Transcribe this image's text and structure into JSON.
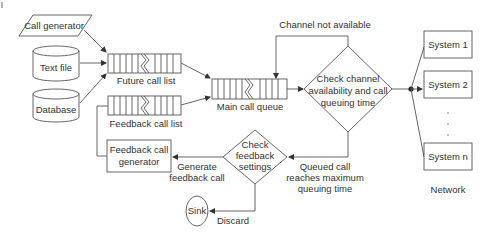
{
  "diagram": {
    "sources": {
      "call_generator": "Call generator",
      "text_file": "Text file",
      "database": "Database"
    },
    "queues": {
      "future_call_list": "Future call list",
      "feedback_call_list": "Feedback call list",
      "main_call_queue": "Main call queue"
    },
    "feedback_generator": {
      "line1": "Feedback call",
      "line2": "generator"
    },
    "decision_channel": {
      "line1": "Check channel",
      "line2": "availability and call",
      "line3": "queuing time"
    },
    "decision_feedback": {
      "line1": "Check",
      "line2": "feedback",
      "line3": "settings"
    },
    "edge_labels": {
      "channel_not_available": "Channel not available",
      "queued_call_1": "Queued call",
      "queued_call_2": "reaches maximum",
      "queued_call_3": "queuing time",
      "generate_1": "Generate",
      "generate_2": "feedback call",
      "discard": "Discard"
    },
    "sink": "Sink",
    "network": {
      "label": "Network",
      "systems": [
        "System 1",
        "System 2",
        "System n"
      ],
      "ellipsis": "·  ·  ·"
    },
    "colors": {
      "stroke": "#555555",
      "text": "#333333",
      "background": "#ffffff"
    }
  }
}
